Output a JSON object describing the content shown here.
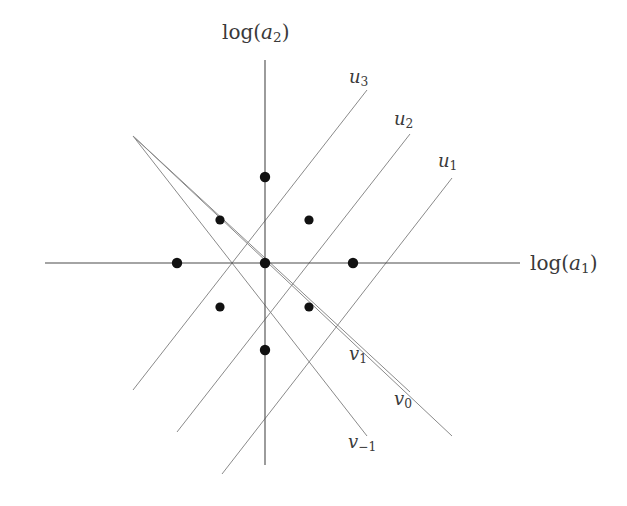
{
  "figure": {
    "title": "",
    "background_color": "#ffffff",
    "axis_color": "#4a4a4a",
    "line_color": "#8a8a8a",
    "dot_color": "#111111",
    "width": 627,
    "height": 506
  },
  "axes": {
    "x": {
      "label_prefix": "log(",
      "label_var": "a",
      "label_sub": "1",
      "label_suffix": ")",
      "label_full": "log(a1)",
      "x1": 45,
      "y1": 263,
      "x2": 520,
      "y2": 263,
      "label_x": 530,
      "label_y": 253
    },
    "y": {
      "label_prefix": "log(",
      "label_var": "a",
      "label_sub": "2",
      "label_suffix": ")",
      "label_full": "log(a2)",
      "x1": 265,
      "y1": 60,
      "x2": 265,
      "y2": 465,
      "label_x": 222,
      "label_y": 22
    }
  },
  "lattice": {
    "center": {
      "x": 265,
      "y": 263
    },
    "spacing": 88,
    "dots": [
      {
        "name": "dot-center",
        "x": 265,
        "y": 263,
        "r": 5.2
      },
      {
        "name": "dot-east",
        "x": 353,
        "y": 263,
        "r": 5.2
      },
      {
        "name": "dot-west",
        "x": 177,
        "y": 263,
        "r": 5.2
      },
      {
        "name": "dot-north",
        "x": 265,
        "y": 177,
        "r": 5.2
      },
      {
        "name": "dot-south",
        "x": 265,
        "y": 350,
        "r": 5.2
      },
      {
        "name": "dot-northeast",
        "x": 309,
        "y": 220,
        "r": 4.6
      },
      {
        "name": "dot-northwest",
        "x": 220,
        "y": 220,
        "r": 4.6
      },
      {
        "name": "dot-southeast",
        "x": 309,
        "y": 307,
        "r": 4.6
      },
      {
        "name": "dot-southwest",
        "x": 220,
        "y": 307,
        "r": 4.6
      }
    ]
  },
  "u_lines": [
    {
      "label": "u3",
      "label_var": "u",
      "label_sub": "3",
      "x1": 133,
      "y1": 390,
      "x2": 367,
      "y2": 90,
      "label_x": 349,
      "label_y": 68
    },
    {
      "label": "u2",
      "label_var": "u",
      "label_sub": "2",
      "x1": 177,
      "y1": 432,
      "x2": 410,
      "y2": 134,
      "label_x": 394,
      "label_y": 110
    },
    {
      "label": "u1",
      "label_var": "u",
      "label_sub": "1",
      "x1": 222,
      "y1": 474,
      "x2": 452,
      "y2": 178,
      "label_x": 438,
      "label_y": 152
    }
  ],
  "v_lines": [
    {
      "label": "v1",
      "label_var": "v",
      "label_sub": "1",
      "x1": 133,
      "y1": 136,
      "x2": 367,
      "y2": 436,
      "label_x": 349,
      "label_y": 345
    },
    {
      "label": "v0",
      "label_var": "v",
      "label_sub": "0",
      "x1": 133,
      "y1": 136,
      "x2": 410,
      "y2": 392,
      "label_x": 394,
      "label_y": 390
    },
    {
      "label": "v-1",
      "label_var": "v",
      "label_sub": "−1",
      "x1": 133,
      "y1": 136,
      "x2": 452,
      "y2": 436,
      "label_x": 348,
      "label_y": 433
    }
  ],
  "chart_data": {
    "type": "scatter",
    "xlabel": "log(a1)",
    "ylabel": "log(a2)",
    "grid": false,
    "legend": "inline-line-labels",
    "lattice_unit": 1,
    "x": [
      0,
      1,
      -1,
      0,
      0,
      1,
      -1,
      1,
      -1
    ],
    "y": [
      0,
      0,
      0,
      1,
      -1,
      1,
      1,
      -1,
      -1
    ],
    "point_labels": [
      "center",
      "east",
      "west",
      "north",
      "south",
      "northeast",
      "northwest",
      "southeast",
      "southwest"
    ],
    "ascending_lines": [
      "u3",
      "u2",
      "u1"
    ],
    "descending_lines": [
      "v1",
      "v0",
      "v-1"
    ],
    "line_slopes": {
      "u": 1,
      "v": -1
    }
  }
}
